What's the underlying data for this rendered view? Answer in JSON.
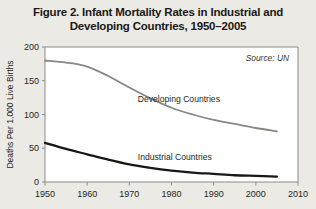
{
  "figure": {
    "title_line1": "Figure 2. Infant Mortality Rates in Industrial and",
    "title_line2": "Developing Countries, 1950–2005",
    "source_note": "Source: UN",
    "background_color": "#eceae5",
    "frame_color": "#8d8a86"
  },
  "chart_data": {
    "type": "line",
    "title": "Figure 2. Infant Mortality Rates in Industrial and Developing Countries, 1950–2005",
    "xlabel": "",
    "ylabel": "Deaths Per 1,000 Live Births",
    "xlim": [
      1950,
      2010
    ],
    "ylim": [
      0,
      200
    ],
    "grid": false,
    "legend": "inline-labels",
    "source": "Source: UN",
    "x_ticks": [
      1950,
      1960,
      1970,
      1980,
      1990,
      2000,
      2010
    ],
    "x_tick_labels": [
      "1950",
      "1960",
      "1970",
      "1980",
      "1990",
      "2000",
      "2010"
    ],
    "y_ticks": [
      0,
      50,
      100,
      150,
      200
    ],
    "y_tick_labels": [
      "0",
      "50",
      "100",
      "150",
      "200"
    ],
    "x": [
      1950,
      1955,
      1960,
      1965,
      1970,
      1975,
      1980,
      1985,
      1990,
      1995,
      2000,
      2005
    ],
    "series": [
      {
        "name": "Developing Countries",
        "color": "#8a8783",
        "label_x": 1972,
        "label_y": 118,
        "values": [
          180,
          177,
          171,
          157,
          140,
          124,
          110,
          100,
          92,
          86,
          80,
          75
        ]
      },
      {
        "name": "Industrial Countries",
        "color": "#1a1715",
        "label_x": 1972,
        "label_y": 33,
        "values": [
          58,
          49,
          41,
          33,
          26,
          21,
          17,
          14,
          12,
          10,
          9,
          8
        ]
      }
    ]
  }
}
